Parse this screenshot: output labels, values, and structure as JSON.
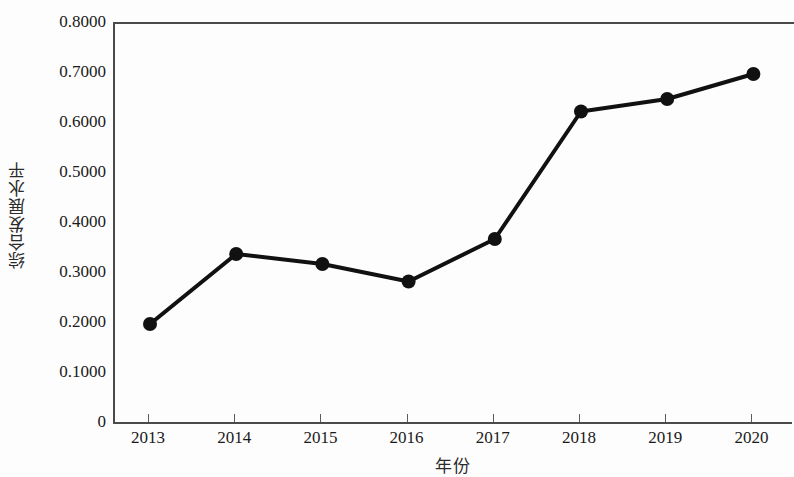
{
  "chart_data": {
    "type": "line",
    "title": "",
    "xlabel": "年份",
    "ylabel": "综合发展水平",
    "categories": [
      "2013",
      "2014",
      "2015",
      "2016",
      "2017",
      "2018",
      "2019",
      "2020"
    ],
    "values": [
      0.2,
      0.34,
      0.32,
      0.285,
      0.37,
      0.625,
      0.65,
      0.7
    ],
    "series": [
      {
        "name": "综合发展水平",
        "values": [
          0.2,
          0.34,
          0.32,
          0.285,
          0.37,
          0.625,
          0.65,
          0.7
        ]
      }
    ],
    "ylim": [
      0,
      0.8
    ],
    "xlim": [
      "2013",
      "2020"
    ],
    "y_ticks": [
      0,
      0.1,
      0.2,
      0.3,
      0.4,
      0.5,
      0.6,
      0.7,
      0.8
    ],
    "y_tick_labels": [
      "0",
      "0.1000",
      "0.2000",
      "0.3000",
      "0.4000",
      "0.5000",
      "0.6000",
      "0.7000",
      "0.8000"
    ],
    "x_tick_labels": [
      "2013",
      "2014",
      "2015",
      "2016",
      "2017",
      "2018",
      "2019",
      "2020"
    ],
    "grid": false,
    "legend": false,
    "legend_position": "none",
    "line_color": "#111111",
    "marker_color": "#111111",
    "marker": "circle",
    "background_color": "#fdfdfd",
    "axis_color": "#4a4a4a"
  }
}
